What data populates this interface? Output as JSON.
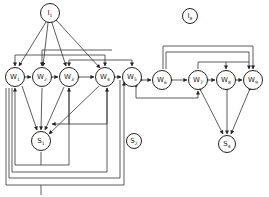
{
  "diagram": {
    "type": "network-graph",
    "nodes": [
      {
        "id": "I1",
        "base": "I",
        "sub": "1",
        "x": 50,
        "y": 13,
        "r": 10
      },
      {
        "id": "I8",
        "base": "I",
        "sub": "8",
        "x": 190,
        "y": 16,
        "r": 8
      },
      {
        "id": "W1",
        "base": "W",
        "sub": "1",
        "x": 15,
        "y": 77,
        "r": 10
      },
      {
        "id": "W2",
        "base": "W",
        "sub": "2",
        "x": 42,
        "y": 77,
        "r": 10
      },
      {
        "id": "W3",
        "base": "W",
        "sub": "3",
        "x": 69,
        "y": 77,
        "r": 10
      },
      {
        "id": "W4",
        "base": "W",
        "sub": "4",
        "x": 105,
        "y": 77,
        "r": 10
      },
      {
        "id": "W5",
        "base": "W",
        "sub": "5",
        "x": 132,
        "y": 77,
        "r": 10
      },
      {
        "id": "W6",
        "base": "W",
        "sub": "6",
        "x": 162,
        "y": 80,
        "r": 10
      },
      {
        "id": "W7",
        "base": "W",
        "sub": "7",
        "x": 198,
        "y": 80,
        "r": 10
      },
      {
        "id": "W8",
        "base": "W",
        "sub": "8",
        "x": 226,
        "y": 80,
        "r": 10
      },
      {
        "id": "W9",
        "base": "W",
        "sub": "9",
        "x": 253,
        "y": 80,
        "r": 10
      },
      {
        "id": "S1",
        "base": "S",
        "sub": "1",
        "x": 41,
        "y": 141,
        "r": 10
      },
      {
        "id": "S2",
        "base": "S",
        "sub": "2",
        "x": 134,
        "y": 141,
        "r": 8
      },
      {
        "id": "S4",
        "base": "S",
        "sub": "4",
        "x": 227,
        "y": 144,
        "r": 9
      }
    ]
  }
}
